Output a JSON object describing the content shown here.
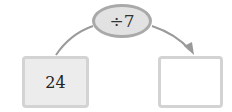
{
  "operation": {
    "label": "÷7"
  },
  "input_box": {
    "value": "24"
  },
  "output_box": {
    "value": ""
  },
  "colors": {
    "ellipse_fill": "#e2e2e2",
    "ellipse_border": "#a9a9a9",
    "arrow": "#999999",
    "box_border": "#d3d3d3",
    "input_fill": "#ececec"
  }
}
